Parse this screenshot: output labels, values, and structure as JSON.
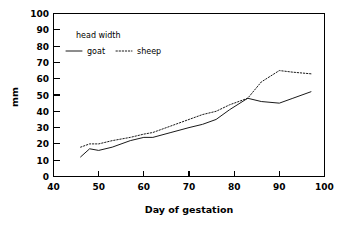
{
  "chart_data": {
    "type": "line",
    "title": "",
    "xlabel": "Day of gestation",
    "ylabel": "mm",
    "xlim": [
      40,
      100
    ],
    "ylim": [
      0,
      100
    ],
    "xticks": [
      40,
      50,
      60,
      70,
      80,
      90,
      100
    ],
    "xtick_labels": [
      "40",
      "50",
      "60",
      "70",
      "80",
      "90",
      "100"
    ],
    "yticks": [
      0,
      10,
      20,
      30,
      40,
      50,
      60,
      70,
      80,
      90,
      100
    ],
    "ytick_labels": [
      "0",
      "10",
      "20",
      "30",
      "40",
      "50",
      "60",
      "70",
      "80",
      "90",
      "100"
    ],
    "grid": false,
    "legend_position": "upper-left-inside",
    "legend_title": "head width",
    "series": [
      {
        "name": "goat",
        "style": "solid",
        "color": "#1a1a1a",
        "x": [
          46,
          48,
          50,
          53,
          57,
          60,
          62,
          66,
          70,
          73,
          76,
          79,
          83,
          86,
          90,
          93,
          97
        ],
        "y": [
          12,
          17,
          16,
          18,
          22,
          24,
          24,
          27,
          30,
          32,
          35,
          41,
          48,
          46,
          45,
          48,
          52
        ]
      },
      {
        "name": "sheep",
        "style": "dotted",
        "color": "#1a1a1a",
        "x": [
          46,
          48,
          50,
          53,
          57,
          60,
          62,
          66,
          70,
          73,
          76,
          79,
          83,
          86,
          90,
          93,
          97
        ],
        "y": [
          18,
          20,
          20,
          22,
          24,
          26,
          27,
          31,
          35,
          38,
          40,
          44,
          48,
          58,
          65,
          64,
          63
        ]
      }
    ]
  },
  "legend": {
    "title": "head width",
    "entries": [
      {
        "label": "goat",
        "style": "solid"
      },
      {
        "label": "sheep",
        "style": "dotted"
      }
    ]
  },
  "axes": {
    "x_title": "Day of gestation",
    "y_title": "mm"
  }
}
